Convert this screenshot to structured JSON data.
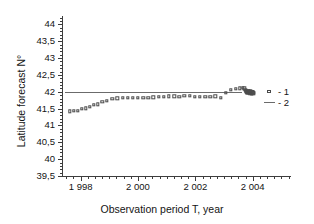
{
  "chart_data": {
    "type": "scatter",
    "title": "",
    "xlabel": "Observation period T, year",
    "ylabel": "Latitude forecast N°",
    "xlim": [
      1997.35,
      2005.3
    ],
    "ylim": [
      39.5,
      44.25
    ],
    "grid": false,
    "legend_position": "right",
    "y_tick_labels": [
      "44",
      "43,5",
      "43",
      "42,5",
      "42",
      "41,5",
      "41",
      "40,5",
      "40",
      "39,5"
    ],
    "y_tick_values": [
      44,
      43.5,
      43,
      42.5,
      42,
      41.5,
      41,
      40.5,
      40,
      39.5
    ],
    "y_minor_step": 0.1,
    "x_tick_labels": [
      "1 998",
      "2 000",
      "2 002",
      "2 004"
    ],
    "x_tick_values": [
      1998,
      2000,
      2002,
      2004
    ],
    "x_minor_step": 0.25,
    "series": [
      {
        "name": "1",
        "legend_label": "- 1",
        "marker": "open-square",
        "color": "#4a4a4a",
        "points": [
          [
            1997.62,
            41.42
          ],
          [
            1997.76,
            41.43
          ],
          [
            1997.9,
            41.44
          ],
          [
            1998.04,
            41.5
          ],
          [
            1998.18,
            41.51
          ],
          [
            1998.32,
            41.56
          ],
          [
            1998.46,
            41.61
          ],
          [
            1998.6,
            41.63
          ],
          [
            1998.76,
            41.71
          ],
          [
            1998.92,
            41.74
          ],
          [
            1999.1,
            41.79
          ],
          [
            1999.28,
            41.81
          ],
          [
            1999.46,
            41.82
          ],
          [
            1999.64,
            41.83
          ],
          [
            1999.82,
            41.82
          ],
          [
            2000.0,
            41.82
          ],
          [
            2000.18,
            41.82
          ],
          [
            2000.36,
            41.83
          ],
          [
            2000.54,
            41.84
          ],
          [
            2000.72,
            41.85
          ],
          [
            2000.9,
            41.86
          ],
          [
            2001.08,
            41.87
          ],
          [
            2001.26,
            41.87
          ],
          [
            2001.44,
            41.86
          ],
          [
            2001.62,
            41.88
          ],
          [
            2001.8,
            41.88
          ],
          [
            2001.98,
            41.86
          ],
          [
            2002.16,
            41.85
          ],
          [
            2002.34,
            41.85
          ],
          [
            2002.52,
            41.86
          ],
          [
            2002.7,
            41.87
          ],
          [
            2002.88,
            41.82
          ],
          [
            2003.06,
            41.97
          ],
          [
            2003.24,
            42.05
          ],
          [
            2003.42,
            42.09
          ],
          [
            2003.56,
            42.1
          ],
          [
            2003.66,
            42.12
          ],
          [
            2003.7,
            42.1
          ],
          [
            2003.74,
            42.06
          ],
          [
            2003.76,
            42.03
          ],
          [
            2003.78,
            42.01
          ],
          [
            2003.79,
            42.0
          ],
          [
            2003.8,
            41.99
          ],
          [
            2003.81,
            41.98
          ],
          [
            2003.82,
            41.97
          ],
          [
            2003.83,
            41.99
          ],
          [
            2003.84,
            42.0
          ],
          [
            2003.85,
            42.01
          ],
          [
            2003.86,
            42.02
          ],
          [
            2003.87,
            42.0
          ],
          [
            2003.88,
            41.98
          ],
          [
            2003.89,
            41.97
          ],
          [
            2003.9,
            41.96
          ],
          [
            2003.91,
            41.98
          ],
          [
            2003.92,
            42.0
          ],
          [
            2003.93,
            42.01
          ],
          [
            2003.94,
            41.99
          ],
          [
            2003.95,
            41.97
          ],
          [
            2003.96,
            41.96
          ],
          [
            2003.97,
            41.95
          ],
          [
            2003.98,
            41.97
          ],
          [
            2003.99,
            41.99
          ],
          [
            2004.0,
            42.0
          ],
          [
            2004.01,
            41.98
          ],
          [
            2004.02,
            41.96
          ],
          [
            2004.03,
            41.97
          ]
        ]
      },
      {
        "name": "2",
        "legend_label": "- 2",
        "type": "hline",
        "color": "#6b6b6b",
        "y_value": 42.0,
        "x_start": 1997.45,
        "x_end": 2003.62
      }
    ]
  }
}
